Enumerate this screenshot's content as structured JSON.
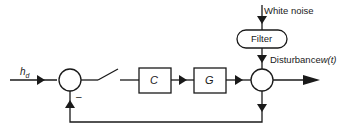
{
  "diagram": {
    "type": "feedback-control-block-diagram",
    "input": {
      "label_main": "h",
      "label_sub": "d"
    },
    "blocks": [
      {
        "id": "controller",
        "label": "C"
      },
      {
        "id": "plant",
        "label": "G"
      }
    ],
    "filter": {
      "label": "Filter"
    },
    "noise_source": {
      "label": "White noise"
    },
    "disturbance": {
      "label_text": "Disturbance",
      "label_var": "w(t)"
    },
    "feedback": {
      "sign": "–"
    },
    "colors": {
      "stroke": "#1a1a1a",
      "background": "#ffffff"
    }
  }
}
